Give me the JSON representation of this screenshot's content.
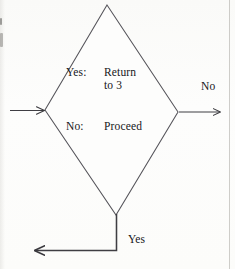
{
  "diagram": {
    "type": "flowchart-decision",
    "shape": {
      "name": "decision-diamond",
      "vertices": {
        "top": [
          107,
          5
        ],
        "left": [
          45,
          110
        ],
        "right": [
          178,
          112
        ],
        "bottom": [
          116,
          215
        ]
      },
      "stroke_color": "#55545a",
      "fill_color": "#fdfdfc"
    },
    "inner_text": {
      "yes_row": {
        "lead": "Yes:",
        "value_line_1": "Return",
        "value_line_2": "to 3"
      },
      "no_row": {
        "lead": "No:",
        "value": "Proceed"
      }
    },
    "connectors": [
      {
        "name": "incoming-left",
        "label": "",
        "from": [
          10,
          110
        ],
        "to": [
          45,
          110
        ],
        "direction": "right",
        "arrowhead": "end"
      },
      {
        "name": "outgoing-right",
        "label": "No",
        "from": [
          178,
          112
        ],
        "to": [
          222,
          112
        ],
        "direction": "right",
        "arrowhead": "end"
      },
      {
        "name": "outgoing-bottom",
        "label": "Yes",
        "from": [
          116,
          215
        ],
        "to": [
          33,
          250
        ],
        "direction": "down-then-left",
        "corner": [
          116,
          250
        ],
        "arrowhead": "end"
      }
    ],
    "labels": {
      "edge_no": "No",
      "edge_yes": "Yes"
    },
    "colors": {
      "ink": "#16161a",
      "line": "#55545a",
      "paper": "#fdfdfc",
      "page_edge": "#a8a6a0"
    }
  }
}
